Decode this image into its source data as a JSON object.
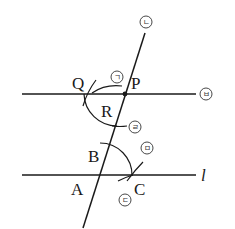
{
  "diagram": {
    "title": "",
    "points": {
      "P": "P",
      "Q": "Q",
      "R": "R",
      "A": "A",
      "B": "B",
      "C": "C"
    },
    "lines": {
      "line_l_label": "l",
      "line_top_marker": "ㅂ"
    },
    "step_markers": {
      "m1": "ㄱ",
      "m2": "ㄴ",
      "m3": "ㄷ",
      "m4": "ㄹ",
      "m5": "ㅁ",
      "m6": "ㅂ"
    },
    "colors": {
      "stroke": "#1a1a1a",
      "background": "#ffffff"
    }
  }
}
